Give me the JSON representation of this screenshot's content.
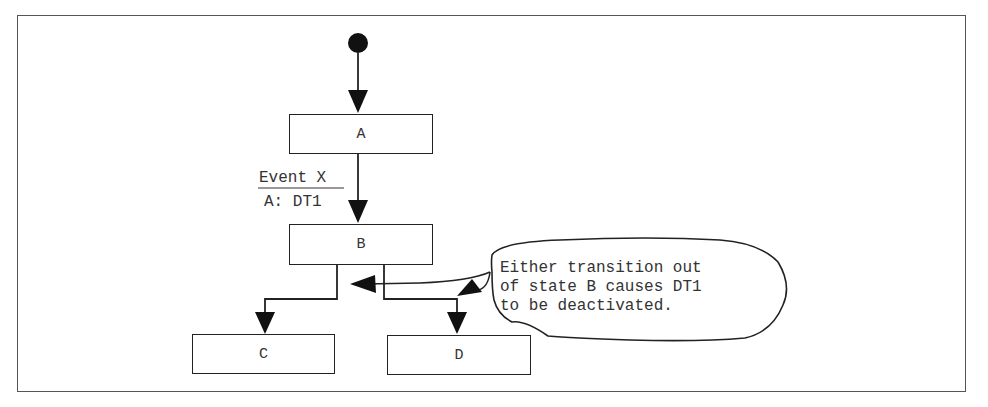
{
  "diagram": {
    "type": "UML state diagram",
    "states": [
      {
        "id": "A",
        "label": "A"
      },
      {
        "id": "B",
        "label": "B"
      },
      {
        "id": "C",
        "label": "C"
      },
      {
        "id": "D",
        "label": "D"
      }
    ],
    "transitions": [
      {
        "from": "initial",
        "to": "A",
        "label": ""
      },
      {
        "from": "A",
        "to": "B",
        "event": "Event X",
        "action": "A: DT1"
      },
      {
        "from": "B",
        "to": "C",
        "label": ""
      },
      {
        "from": "B",
        "to": "D",
        "label": ""
      }
    ],
    "note": {
      "lines": [
        "Either transition out",
        "of state B causes DT1",
        "to be deactivated."
      ]
    },
    "colors": {
      "line": "#222222",
      "frame": "#555555",
      "text": "#333333"
    }
  }
}
